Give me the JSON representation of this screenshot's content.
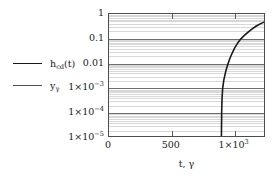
{
  "chart_data": {
    "type": "line",
    "title": "",
    "xlabel": "t, γ",
    "ylabel": "",
    "xlim": [
      0,
      1250
    ],
    "ylim": [
      1e-05,
      1
    ],
    "yscale": "log",
    "xscale": "linear",
    "grid": true,
    "grid_minor": true,
    "legend_position": "left-outside",
    "xticks": [
      {
        "value": 0,
        "label": "0"
      },
      {
        "value": 500,
        "label": "500"
      },
      {
        "value": 1000,
        "label": "1×10³",
        "base": "1×10",
        "exp": "3"
      }
    ],
    "yticks": [
      {
        "value": 1,
        "label": "1"
      },
      {
        "value": 0.1,
        "label": "0.1"
      },
      {
        "value": 0.01,
        "label": "0.01"
      },
      {
        "value": 0.001,
        "label": "1×10⁻³",
        "base": "1×10",
        "exp": "−3"
      },
      {
        "value": 0.0001,
        "label": "1×10⁻⁴",
        "base": "1×10",
        "exp": "−4"
      },
      {
        "value": 1e-05,
        "label": "1×10⁻⁵",
        "base": "1×10",
        "exp": "−5"
      }
    ],
    "series": [
      {
        "name": "h_cd(t)",
        "label_base": "h",
        "label_sub": "cd",
        "label_tail": "(t)",
        "color": "#1a1a1a",
        "linewidth": 1.6,
        "points": [
          {
            "x": 895,
            "y": 1e-05
          },
          {
            "x": 897,
            "y": 0.0001
          },
          {
            "x": 900,
            "y": 0.0004
          },
          {
            "x": 905,
            "y": 0.001
          },
          {
            "x": 915,
            "y": 0.0023
          },
          {
            "x": 930,
            "y": 0.005
          },
          {
            "x": 945,
            "y": 0.009
          },
          {
            "x": 960,
            "y": 0.015
          },
          {
            "x": 980,
            "y": 0.026
          },
          {
            "x": 1000,
            "y": 0.042
          },
          {
            "x": 1025,
            "y": 0.068
          },
          {
            "x": 1050,
            "y": 0.1
          },
          {
            "x": 1080,
            "y": 0.14
          },
          {
            "x": 1110,
            "y": 0.19
          },
          {
            "x": 1140,
            "y": 0.25
          },
          {
            "x": 1170,
            "y": 0.32
          },
          {
            "x": 1200,
            "y": 0.39
          },
          {
            "x": 1230,
            "y": 0.46
          },
          {
            "x": 1250,
            "y": 0.52
          }
        ]
      },
      {
        "name": "y_γ",
        "label_base": "y",
        "label_sub": "γ",
        "label_tail": "",
        "color": "#4a4a4a",
        "linewidth": 1.4,
        "points": []
      }
    ]
  },
  "legend": {
    "items": [
      {
        "label_base": "h",
        "label_sub": "cd",
        "label_tail": "(t)",
        "color": "#1a1a1a",
        "width": 1.8
      },
      {
        "label_base": "y",
        "label_sub": "γ",
        "label_tail": "",
        "color": "#4f4f4f",
        "width": 1.6
      }
    ]
  },
  "colors": {
    "frame": "#4d4d4d",
    "grid_major": "#6e6e6e",
    "grid_minor": "#d8d8d8",
    "background": "#ffffff",
    "text": "#1a1a1a"
  }
}
